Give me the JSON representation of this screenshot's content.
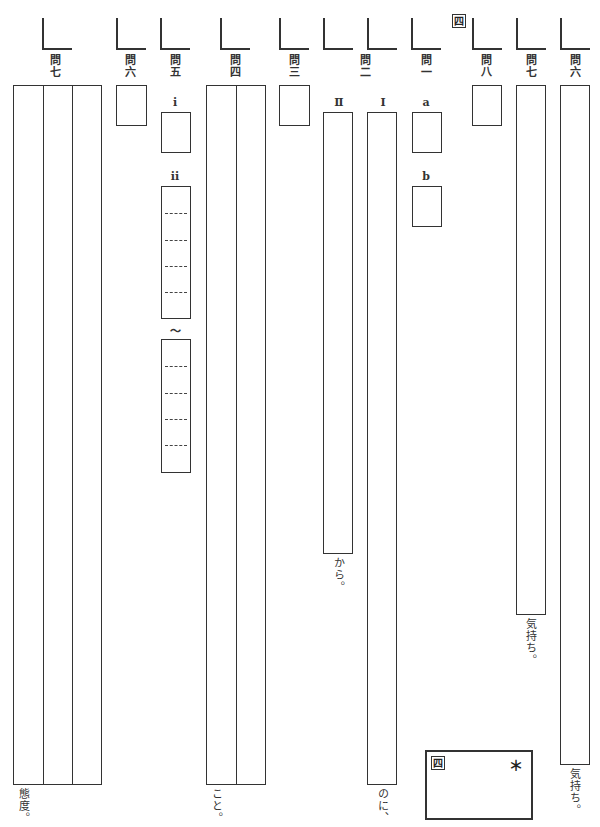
{
  "section": {
    "number": "四"
  },
  "questions": [
    {
      "id": "q7_left",
      "label": "問七",
      "suffix": "態度。"
    },
    {
      "id": "q6_left",
      "label": "問六"
    },
    {
      "id": "q5",
      "label": "問五",
      "parts": [
        {
          "label": "i"
        },
        {
          "label": "ii"
        },
        {
          "label": "〜"
        }
      ]
    },
    {
      "id": "q4",
      "label": "問四",
      "suffix": "こと。"
    },
    {
      "id": "q3",
      "label": "問三"
    },
    {
      "id": "q2",
      "label": "問二",
      "parts": [
        {
          "label": "Ⅱ",
          "suffix": "から。"
        },
        {
          "label": "Ⅰ",
          "suffix": "のに、"
        }
      ]
    },
    {
      "id": "q1",
      "label": "問一",
      "parts": [
        {
          "label": "a"
        },
        {
          "label": "b"
        }
      ]
    },
    {
      "id": "q8",
      "label": "問八"
    },
    {
      "id": "q7_right",
      "label": "問七",
      "suffix": "気持ち。"
    },
    {
      "id": "q6_right",
      "label": "問六",
      "suffix": "気持ち。"
    }
  ],
  "score_box": {
    "section": "四",
    "mark": "＊"
  }
}
